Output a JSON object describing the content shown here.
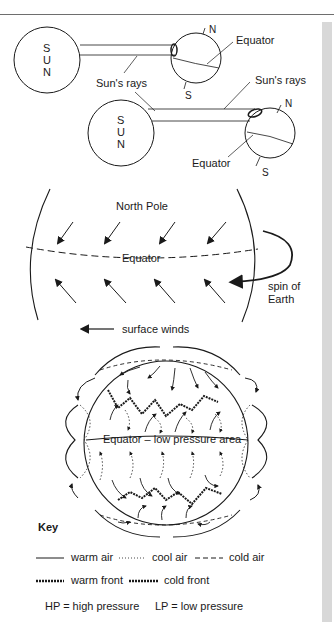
{
  "panel1": {
    "sun_letters": [
      "S",
      "U",
      "N"
    ],
    "rays_label": "Sun's rays",
    "north_label": "N",
    "south_label": "S",
    "equator_label": "Equator"
  },
  "panel2": {
    "sun_letters": [
      "S",
      "U",
      "N"
    ],
    "rays_label": "Sun's rays",
    "north_label": "N",
    "south_label": "S",
    "equator_label": "Equator"
  },
  "panel3": {
    "north_pole_label": "North Pole",
    "equator_label": "Equator",
    "spin_label_line1": "spin of",
    "spin_label_line2": "Earth",
    "winds_label": "surface winds"
  },
  "panel4": {
    "equator_label": "Equator – low pressure area"
  },
  "key": {
    "title": "Key",
    "warm_air": "warm air",
    "cool_air": "cool air",
    "cold_air": "cold air",
    "warm_front": "warm front",
    "cold_front": "cold front",
    "hp": "HP = high pressure",
    "lp": "LP = low pressure"
  }
}
